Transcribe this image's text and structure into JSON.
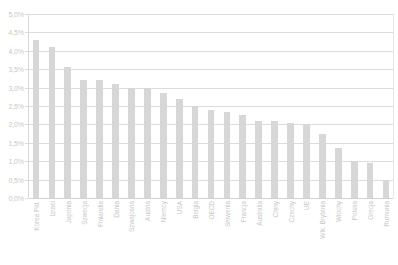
{
  "chart_data": {
    "type": "bar",
    "title": "",
    "subtitle": "",
    "xlabel": "",
    "ylabel": "",
    "ylim": [
      0,
      5
    ],
    "ytick_labels": [
      "5,0%",
      "4,5%",
      "4,0%",
      "3,5%",
      "3,0%",
      "2,5%",
      "2,0%",
      "1,5%",
      "1,0%",
      "0,5%",
      "0,0%"
    ],
    "ytick_values": [
      5.0,
      4.5,
      4.0,
      3.5,
      3.0,
      2.5,
      2.0,
      1.5,
      1.0,
      0.5,
      0.0
    ],
    "grid": true,
    "legend": "none",
    "value_suffix": "%",
    "categories": [
      "Korea Płd.",
      "Izrael",
      "Japonia",
      "Szwecja",
      "Finlandia",
      "Dania",
      "Szwajcaria",
      "Austria",
      "Niemcy",
      "USA",
      "Belgia",
      "OECD",
      "Słowenia",
      "Francja",
      "Australia",
      "Chiny",
      "Czechy",
      "UE",
      "Wlk. Brytania",
      "Włochy",
      "Polska",
      "Grecja",
      "Rumunia"
    ],
    "values": [
      4.3,
      4.1,
      3.55,
      3.2,
      3.2,
      3.1,
      3.0,
      3.0,
      2.85,
      2.7,
      2.5,
      2.4,
      2.35,
      2.25,
      2.1,
      2.1,
      2.05,
      2.0,
      1.75,
      1.35,
      1.0,
      0.95,
      0.5
    ],
    "bar_color": "#d7d7d7",
    "grid_color": "#dcdcdc",
    "axis_label_color": "#c8c8c8",
    "background_color": "#ffffff"
  }
}
